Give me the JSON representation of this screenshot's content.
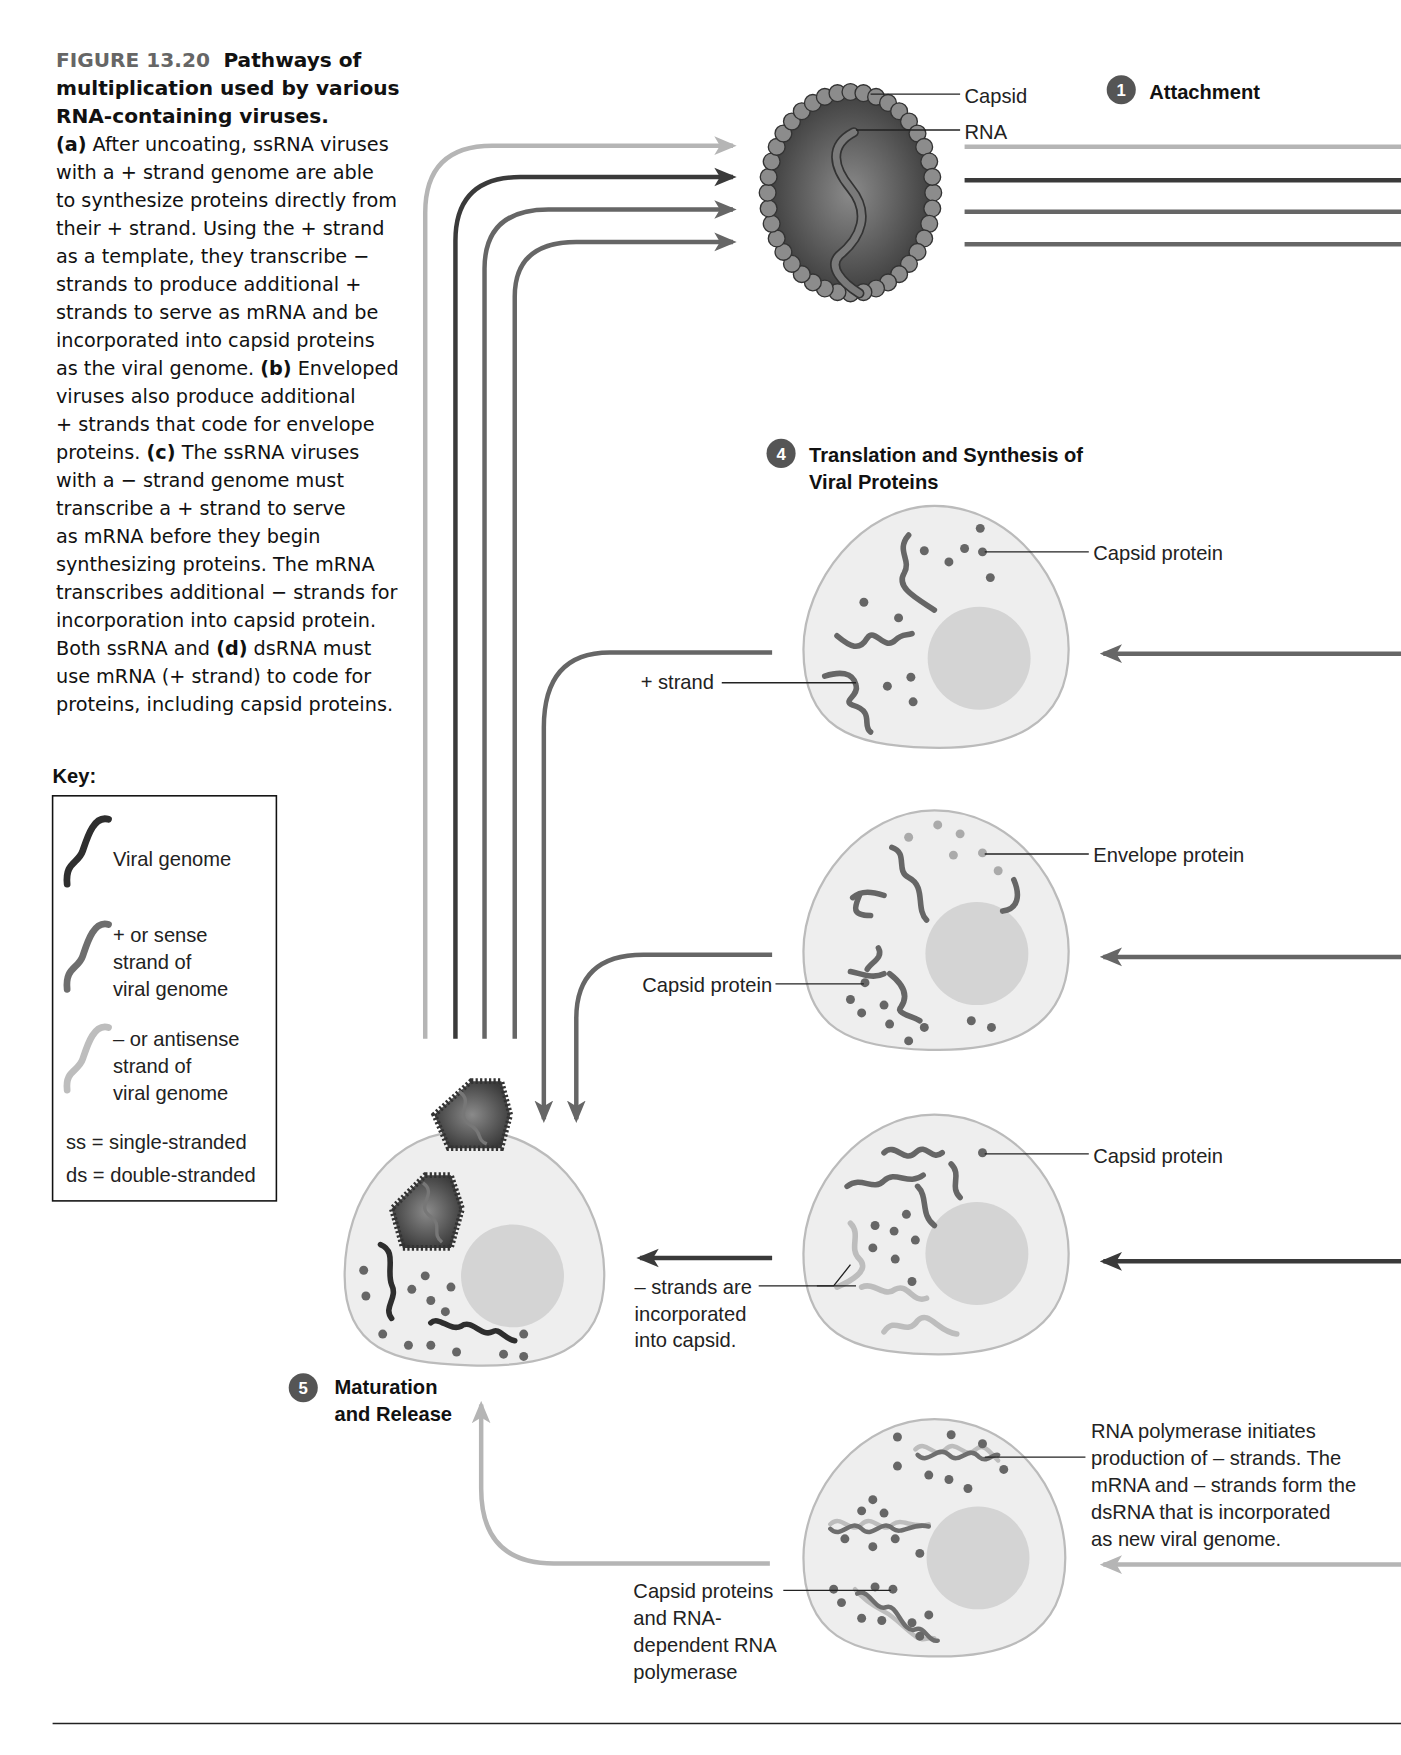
{
  "caption": {
    "figure_label": "FIGURE 13.20",
    "title_line1": "Pathways of",
    "title_line2": "multiplication used by various",
    "title_line3": "RNA-containing viruses.",
    "body_lines": [
      [
        {
          "b": "(a)"
        },
        {
          "t": " After uncoating, ssRNA viruses"
        }
      ],
      [
        {
          "t": "with a + strand genome are able"
        }
      ],
      [
        {
          "t": "to synthesize proteins directly from"
        }
      ],
      [
        {
          "t": "their + strand. Using the + strand"
        }
      ],
      [
        {
          "t": "as a template, they transcribe −"
        }
      ],
      [
        {
          "t": "strands to produce additional +"
        }
      ],
      [
        {
          "t": "strands to serve as mRNA and be"
        }
      ],
      [
        {
          "t": "incorporated into capsid proteins"
        }
      ],
      [
        {
          "t": "as the viral genome. "
        },
        {
          "b": "(b)"
        },
        {
          "t": " Enveloped"
        }
      ],
      [
        {
          "t": "viruses also produce additional"
        }
      ],
      [
        {
          "t": "+ strands that code for envelope"
        }
      ],
      [
        {
          "t": "proteins. "
        },
        {
          "b": "(c)"
        },
        {
          "t": " The ssRNA viruses"
        }
      ],
      [
        {
          "t": "with a − strand genome must"
        }
      ],
      [
        {
          "t": "transcribe a + strand to serve"
        }
      ],
      [
        {
          "t": "as mRNA before they begin"
        }
      ],
      [
        {
          "t": "synthesizing proteins. The mRNA"
        }
      ],
      [
        {
          "t": "transcribes additional − strands for"
        }
      ],
      [
        {
          "t": "incorporation into capsid protein."
        }
      ],
      [
        {
          "t": "Both ssRNA and "
        },
        {
          "b": "(d)"
        },
        {
          "t": " dsRNA must"
        }
      ],
      [
        {
          "t": "use mRNA (+ strand) to code for"
        }
      ],
      [
        {
          "t": "proteins, including capsid proteins."
        }
      ]
    ]
  },
  "key": {
    "heading": "Key:",
    "items": [
      {
        "icon": "viral-genome-strand-icon",
        "color": "#2e2e2e",
        "lines": [
          "Viral genome"
        ]
      },
      {
        "icon": "sense-strand-icon",
        "color": "#6e6e6e",
        "lines": [
          "+ or sense",
          "strand of",
          "viral genome"
        ]
      },
      {
        "icon": "antisense-strand-icon",
        "color": "#bdbdbd",
        "lines": [
          "– or antisense",
          "strand of",
          "viral genome"
        ]
      }
    ],
    "abbreviations": [
      "ss = single-stranded",
      "ds = double-stranded"
    ]
  },
  "virion": {
    "capsid_label": "Capsid",
    "rna_label": "RNA"
  },
  "steps": {
    "attachment": {
      "number": "1",
      "label": "Attachment"
    },
    "translation": {
      "number": "4",
      "line1": "Translation and Synthesis of",
      "line2": "Viral Proteins"
    },
    "maturation": {
      "number": "5",
      "line1": "Maturation",
      "line2": "and Release"
    }
  },
  "pathways": {
    "a": {
      "cell_label": "Capsid protein",
      "left_label": "+ strand"
    },
    "b": {
      "cell_label": "Envelope protein",
      "left_label": "Capsid protein"
    },
    "c": {
      "cell_label": "Capsid protein",
      "left_lines": [
        "– strands are",
        "incorporated",
        "into capsid."
      ]
    },
    "d": {
      "right_lines": [
        "RNA polymerase initiates",
        "production of – strands.  The",
        "mRNA and – strands form the",
        "dsRNA that is incorporated",
        "as new viral genome."
      ],
      "left_lines": [
        "Capsid proteins",
        "and RNA-",
        "dependent RNA",
        "polymerase"
      ]
    }
  },
  "colors": {
    "viral_genome": "#2e2e2e",
    "sense_strand": "#6e6e6e",
    "antisense_strand": "#bdbdbd",
    "cell_fill": "#eeeeee",
    "nucleus_fill": "#d4d4d4",
    "step_badge": "#555555"
  }
}
